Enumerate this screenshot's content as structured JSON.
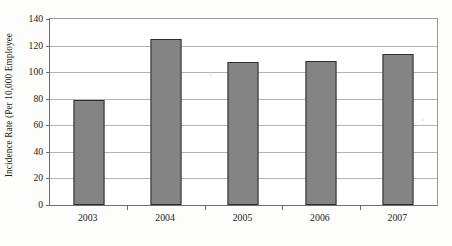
{
  "chart_data": {
    "type": "bar",
    "title": "",
    "xlabel": "",
    "ylabel": "Incidence Rate (Per 10,000 Employee",
    "categories": [
      "2003",
      "2004",
      "2005",
      "2006",
      "2007"
    ],
    "values": [
      79,
      125,
      108,
      108.5,
      114
    ],
    "series": [
      {
        "name": "Incidence Rate",
        "values": [
          79,
          125,
          108,
          108.5,
          114
        ]
      }
    ],
    "ylim": [
      0,
      140
    ],
    "ytick_step": 20,
    "ytick_labels": [
      "0",
      "20",
      "40",
      "60",
      "80",
      "100",
      "120",
      "140"
    ],
    "ytick_values": [
      0,
      20,
      40,
      60,
      80,
      100,
      120,
      140
    ],
    "grid": true,
    "grid_axis": "y",
    "legend": false,
    "legend_position": "none",
    "bar_fill_color": "#848484",
    "bar_edge_color": "#2f2f2f",
    "gridline_color": "#b4b4b4",
    "axis_color": "#6e6e6e",
    "background_color": "#ffffff"
  }
}
